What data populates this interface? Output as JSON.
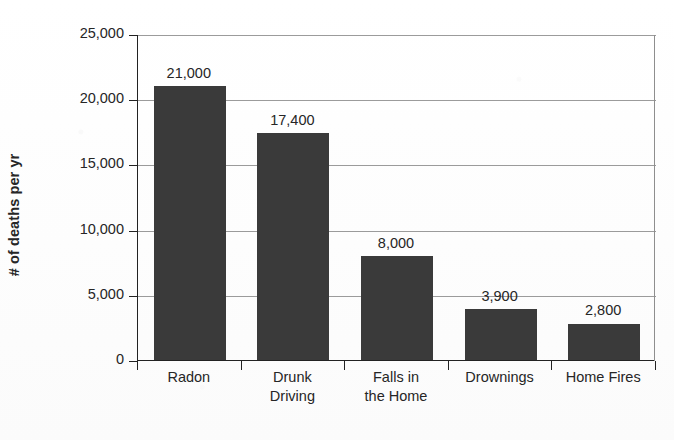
{
  "chart_data": {
    "type": "bar",
    "title": "",
    "subtitle": "",
    "xlabel": "",
    "ylabel": "# of deaths per yr",
    "categories": [
      "Radon",
      "Drunk Driving",
      "Falls in the Home",
      "Drownings",
      "Home Fires"
    ],
    "category_lines": [
      [
        "Radon"
      ],
      [
        "Drunk",
        "Driving"
      ],
      [
        "Falls in",
        "the Home"
      ],
      [
        "Drownings"
      ],
      [
        "Home Fires"
      ]
    ],
    "values": [
      21000,
      17400,
      8000,
      3900,
      2800
    ],
    "value_labels": [
      "21,000",
      "17,400",
      "8,000",
      "3,900",
      "2,800"
    ],
    "ylim": [
      0,
      25000
    ],
    "ytick_values": [
      0,
      5000,
      10000,
      15000,
      20000,
      25000
    ],
    "ytick_labels": [
      "0",
      "5,000",
      "10,000",
      "15,000",
      "20,000",
      "25,000"
    ],
    "grid": true,
    "grid_axis": "y",
    "legend": false,
    "legend_position": "none",
    "bar_color": "#3a3a3a",
    "grid_color": "#9b9b9b",
    "axis_color": "#222222",
    "background_color": "#ffffff",
    "text_color": "#262626"
  }
}
